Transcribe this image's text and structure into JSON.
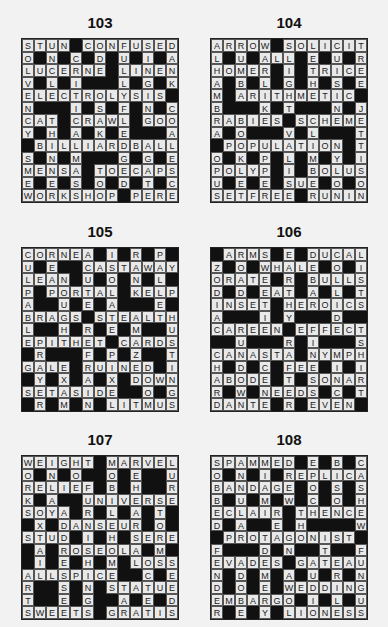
{
  "puzzles": [
    {
      "number": "103",
      "rows": [
        "STUN#CONFUSED",
        "O#N#C#D#U#I#A",
        "LUCERNE#LINEN",
        "V#L#I###L#G#K",
        "ELECTROLYSIS#",
        "N###I#S#F#N#C",
        "CAT#CRAWL#GOO",
        "Y#H#A#K#E###A",
        "#BILLIARDBALL",
        "S#N#M###G#G#E",
        "MENSA#TOECAPS",
        "E#E#S#O#D#T#C",
        "WORKSHOP#PERE"
      ]
    },
    {
      "number": "104",
      "rows": [
        "ARROW#SOLICIT",
        "L#U#ALL#E#U#R",
        "HOMER#I#TRICE",
        "A#B#L#G#H#S#E",
        "M#ARITHMETIC#",
        "B###K#T###N#J",
        "RABIES#SCHEME",
        "A#O###V#L###T",
        "#POPULATION#T",
        "O#K#P#L#M#Y#I",
        "POLYP#I#BOLUS",
        "U#E#E#SUE#O#O",
        "SETFREE#RUNIN"
      ]
    },
    {
      "number": "105",
      "rows": [
        "CORNEA#I#R#P#",
        "U#E##CASTAWAY",
        "LEAN#U#O#N#L#",
        "P#PORTAL#KELP",
        "A##U#E#A###E#",
        "BRAGS#STEALTH",
        "L##H#R#E#M##U",
        "EPITHET#CARDS",
        "#R###F#P#Z##T",
        "GALE#RUINED#I",
        "#Y#X#A#X#DOWN",
        "SETASIDE##O#G",
        "#R#M#N#LITMUS"
      ]
    },
    {
      "number": "106",
      "rows": [
        "#ARMS#E#DUCAL",
        "Z#O#WHALE#O#I",
        "ORATE#R#BULLS",
        "D#D#EAT#A#L#T",
        "INSET#HEROICS",
        "A###I#Y###D##",
        "CAREEN#EFFECT",
        "##U###R#I###S",
        "CANASTA#NYMPH",
        "H#D#C#FEE#I#I",
        "ABODE#T#SONAR",
        "R#W#NEEDS#C#T",
        "DANTE#R#EVEN#"
      ]
    },
    {
      "number": "107",
      "rows": [
        "WEIGHT#MARVEL",
        "O#N#O##O#E##U",
        "RELIEF#B#H##R",
        "K#A##UNIVERSE",
        "SOYA#R#L#A#T#",
        "#X#DANSEUR#O#",
        "STUD#I#H#SERE",
        "#A#ROSEOLA#M#",
        "#I#E#H#M#LOSS",
        "ALLSPICE##C#E",
        "R##S#N#STATUE",
        "T##E#G##A#E#D",
        "SWEETS#GRATIS"
      ]
    },
    {
      "number": "108",
      "rows": [
        "SPAMMED#E#B#C",
        "O#N#I#REPLICA",
        "BANDAGE#O#S#S",
        "B#U#M#W#C#O#H",
        "ECLAIR#THENCE",
        "D#A##E#H####W",
        "#PROTAGONIST#",
        "F###D#N##T##F",
        "EVADES#GATEAU",
        "N#D#M#A#U#R#N",
        "D#O#E#WEDDING",
        "EMBARGO#I#L#U",
        "R#E#Y#LIONESS"
      ]
    }
  ],
  "colors": {
    "background": "#f2f2f2",
    "cell": "#e9e9e9",
    "black_cell": "#111111",
    "text": "#222222"
  }
}
